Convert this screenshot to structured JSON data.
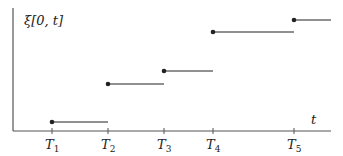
{
  "diagram": {
    "y_label": "ξ[0, t]",
    "x_label": "t",
    "colors": {
      "axis": "#555555",
      "step": "#222222",
      "text": "#222222"
    },
    "ticks": [
      {
        "base": "T",
        "sub": "1",
        "x": 52
      },
      {
        "base": "T",
        "sub": "2",
        "x": 108
      },
      {
        "base": "T",
        "sub": "3",
        "x": 164
      },
      {
        "base": "T",
        "sub": "4",
        "x": 213
      },
      {
        "base": "T",
        "sub": "5",
        "x": 294
      }
    ],
    "steps": [
      {
        "x1": 52,
        "x2": 108,
        "y": 122
      },
      {
        "x1": 108,
        "x2": 164,
        "y": 84
      },
      {
        "x1": 164,
        "x2": 213,
        "y": 71
      },
      {
        "x1": 213,
        "x2": 294,
        "y": 32
      },
      {
        "x1": 294,
        "x2": 331,
        "y": 20
      }
    ]
  }
}
